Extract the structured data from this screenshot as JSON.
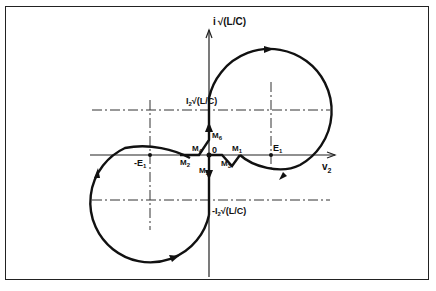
{
  "figure": {
    "type": "phase-plane diagram",
    "colors": {
      "stroke": "#111111",
      "frame": "#222222",
      "background": "#ffffff"
    },
    "axes": {
      "x_label": "v",
      "x_label_sub": "2",
      "y_label": "i",
      "y_label_expr": "√(L/C)",
      "origin_label": "0"
    },
    "points": {
      "E1": {
        "label": "E",
        "sub": "1"
      },
      "minus_E1": {
        "label": "-E",
        "sub": "1"
      },
      "M1": {
        "label": "M",
        "sub": "1"
      },
      "M2": {
        "label": "M",
        "sub": "2"
      },
      "M3": {
        "label": "M",
        "sub": "3"
      },
      "M4": {
        "label": "M",
        "sub": "4"
      },
      "M5": {
        "label": "M",
        "sub": "5"
      },
      "M6": {
        "label": "M",
        "sub": "6"
      }
    },
    "levels": {
      "upper": {
        "prefix": "I",
        "sub": "2",
        "expr": "√(L/C)"
      },
      "lower": {
        "prefix": "-I",
        "sub": "2",
        "expr": "√(L/C)"
      }
    }
  }
}
